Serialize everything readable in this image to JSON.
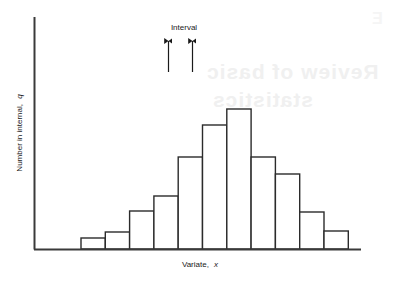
{
  "chart_data": {
    "type": "bar",
    "title": "",
    "subtitle": "",
    "xlabel": "Variate, x",
    "xlabel_main": "Variate,",
    "xlabel_italic": "x",
    "ylabel": "Number in internal, q",
    "ylabel_main": "Number in internal,",
    "ylabel_italic": "q",
    "grid": false,
    "legend": "none",
    "axis_ranges": {
      "x_bin_count": 12,
      "ylim": [
        0,
        13
      ]
    },
    "categories": [
      "1",
      "2",
      "3",
      "4",
      "5",
      "6",
      "7",
      "8",
      "9",
      "10",
      "11",
      "12"
    ],
    "values": [
      0.6,
      1.2,
      3.0,
      4.6,
      7.6,
      10.5,
      12.0,
      7.6,
      6.3,
      3.1,
      1.5,
      0.0
    ],
    "bar_tops_px": [
      238,
      232,
      211,
      196,
      157,
      125,
      109,
      157,
      174,
      212,
      231,
      249
    ],
    "bar_left_px": 81,
    "bar_width_px": 24.3,
    "baseline_px": 249,
    "annotations": [
      {
        "name": "interval",
        "label": "Interval",
        "label_x": 184,
        "label_y": 30,
        "marker_left_x": 168,
        "marker_right_x": 192,
        "marker_top_y": 40,
        "marker_bottom_y": 72
      }
    ],
    "colors": {
      "bar_stroke": "#2b2b2b",
      "bar_fill": "#ffffff",
      "axis": "#3a3a3a",
      "text": "#1a1a1a",
      "background": "#ffffff",
      "bleed_text": "#f0f0f0"
    }
  },
  "bleed": {
    "line1": "Review of basic",
    "line2": "statistics",
    "line3": "Standard d",
    "line4": "E"
  }
}
